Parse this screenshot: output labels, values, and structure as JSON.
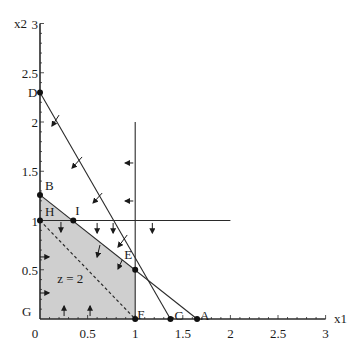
{
  "figure": {
    "title": "",
    "background": "#ffffff",
    "line_color": "#2a2a2a",
    "region_fill": "#cfcfcf",
    "x_axis": {
      "label": "x1",
      "range": [
        0,
        3
      ],
      "tick_labels": [
        {
          "value": 0,
          "text": "0"
        },
        {
          "value": 0.5,
          "text": "0.5"
        },
        {
          "value": 1,
          "text": "1"
        },
        {
          "value": 1.5,
          "text": "1.5"
        },
        {
          "value": 2,
          "text": "2"
        },
        {
          "value": 2.5,
          "text": "2.5"
        },
        {
          "value": 3,
          "text": "3"
        }
      ]
    },
    "y_axis": {
      "label": "x2",
      "range": [
        0,
        3
      ],
      "tick_labels": [
        {
          "value": 0.5,
          "text": "0.5"
        },
        {
          "value": 1,
          "text": "1"
        },
        {
          "value": 1.5,
          "text": "1.5"
        },
        {
          "value": 2,
          "text": "2"
        },
        {
          "value": 2.5,
          "text": "2.5"
        },
        {
          "value": 3,
          "text": "3"
        }
      ]
    },
    "points": [
      {
        "name": "D",
        "x": 0,
        "y": 2.3,
        "label_dx": -12,
        "label_dy": 5
      },
      {
        "name": "B",
        "x": 0,
        "y": 1.26,
        "label_dx": 5,
        "label_dy": -5
      },
      {
        "name": "H",
        "x": 0,
        "y": 1,
        "label_dx": 5,
        "label_dy": -5
      },
      {
        "name": "I",
        "x": 0.35,
        "y": 1,
        "label_dx": 2,
        "label_dy": -6
      },
      {
        "name": "E",
        "x": 1,
        "y": 0.5,
        "label_dx": -11,
        "label_dy": -11
      },
      {
        "name": "F",
        "x": 1,
        "y": 0,
        "label_dx": 2,
        "label_dy": 0
      },
      {
        "name": "C",
        "x": 1.37,
        "y": 0,
        "label_dx": 4,
        "label_dy": 1
      },
      {
        "name": "A",
        "x": 1.65,
        "y": 0,
        "label_dx": 3,
        "label_dy": 1
      },
      {
        "name": "G",
        "x": 0,
        "y": 0,
        "label_dx": -18,
        "label_dy": -3,
        "no_dot": true
      }
    ],
    "lines": [
      {
        "name": "constraint-line-DC",
        "from": [
          0,
          2.3
        ],
        "to": [
          1.37,
          0
        ],
        "dashed": false
      },
      {
        "name": "constraint-line-BA",
        "from": [
          0,
          1.26
        ],
        "to": [
          1.65,
          0
        ],
        "dashed": false
      },
      {
        "name": "constraint-line-x1-eq-1",
        "from": [
          1,
          0
        ],
        "to": [
          1,
          2.0
        ],
        "dashed": false
      },
      {
        "name": "constraint-line-x2-eq-1",
        "from": [
          0,
          1
        ],
        "to": [
          2,
          1
        ],
        "dashed": false
      },
      {
        "name": "objective-line-z-eq-2",
        "from": [
          0,
          1
        ],
        "to": [
          1,
          0
        ],
        "dashed": true
      }
    ],
    "feasible_region": [
      [
        0,
        0
      ],
      [
        0,
        1.26
      ],
      [
        1,
        0.5
      ],
      [
        1,
        0
      ]
    ],
    "region_label": {
      "text": "z = 2",
      "x": 0.18,
      "y": 0.37
    },
    "arrows": [
      {
        "from": [
          0.2,
          2.07
        ],
        "to": [
          0.126,
          1.96
        ]
      },
      {
        "from": [
          0.442,
          1.645
        ],
        "to": [
          0.337,
          1.533
        ]
      },
      {
        "from": [
          0.653,
          1.279
        ],
        "to": [
          0.558,
          1.178
        ]
      },
      {
        "from": [
          0.98,
          1.584
        ],
        "to": [
          0.895,
          1.584
        ]
      },
      {
        "from": [
          0.98,
          1.198
        ],
        "to": [
          0.895,
          1.198
        ]
      },
      {
        "from": [
          0.22,
          0.985
        ],
        "to": [
          0.22,
          0.883
        ]
      },
      {
        "from": [
          0.6,
          0.975
        ],
        "to": [
          0.6,
          0.873
        ]
      },
      {
        "from": [
          0.768,
          0.975
        ],
        "to": [
          0.768,
          0.873
        ]
      },
      {
        "from": [
          1.18,
          0.975
        ],
        "to": [
          1.18,
          0.873
        ]
      },
      {
        "from": [
          0.916,
          0.853
        ],
        "to": [
          0.82,
          0.731
        ]
      },
      {
        "from": [
          0.63,
          0.751
        ],
        "to": [
          0.6,
          0.629
        ]
      },
      {
        "from": [
          0.863,
          0.599
        ],
        "to": [
          0.82,
          0.508
        ]
      },
      {
        "from": [
          0.0,
          0.63
        ],
        "to": [
          0.095,
          0.63
        ]
      },
      {
        "from": [
          0.0,
          0.264
        ],
        "to": [
          0.095,
          0.264
        ]
      },
      {
        "from": [
          0.253,
          0.03
        ],
        "to": [
          0.253,
          0.132
        ]
      },
      {
        "from": [
          0.526,
          0.03
        ],
        "to": [
          0.526,
          0.132
        ]
      }
    ]
  }
}
